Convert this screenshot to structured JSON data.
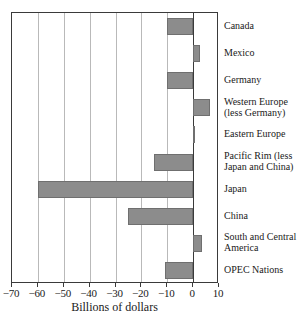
{
  "chart_data": {
    "type": "bar",
    "orientation": "horizontal",
    "title": "",
    "xlabel": "Billions of dollars",
    "ylabel": "",
    "xlim": [
      -70,
      10
    ],
    "xticks": [
      -70,
      -60,
      -50,
      -40,
      -30,
      -20,
      -10,
      0,
      10
    ],
    "xticklabels": [
      "-70",
      "-60",
      "-50",
      "-40",
      "-30",
      "-20",
      "-10",
      "0",
      "10"
    ],
    "grid": "vertical",
    "legend": "none",
    "categories": [
      "Canada",
      "Mexico",
      "Germany",
      "Western Europe (less Germany)",
      "Eastern Europe",
      "Pacific Rim (less Japan and China)",
      "Japan",
      "China",
      "South and Central America",
      "OPEC Nations"
    ],
    "category_lines": [
      [
        "Canada"
      ],
      [
        "Mexico"
      ],
      [
        "Germany"
      ],
      [
        "Western Europe",
        "(less Germany)"
      ],
      [
        "Eastern Europe"
      ],
      [
        "Pacific Rim (less",
        "Japan and China)"
      ],
      [
        "Japan"
      ],
      [
        "China"
      ],
      [
        "South and Central",
        "America"
      ],
      [
        "OPEC Nations"
      ]
    ],
    "values": [
      -10,
      2.5,
      -10,
      6.5,
      0.5,
      -15,
      -60,
      -25,
      3.5,
      -11
    ],
    "bar_color": "#8c8c8c",
    "bar_edge_color": "#6f6f6f",
    "grid_color": "#b9b9b9",
    "axis_color": "#3a3a3a"
  }
}
